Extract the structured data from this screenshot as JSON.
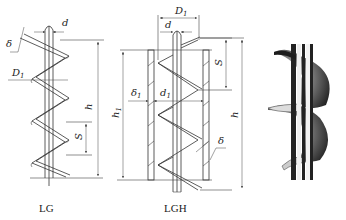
{
  "diagrams": [
    {
      "id": "LG",
      "caption": "LG",
      "labels": {
        "d": "d",
        "delta": "δ",
        "D1": "D",
        "D1_sub": "1",
        "h": "h",
        "S": "S"
      }
    },
    {
      "id": "LGH",
      "caption": "LGH",
      "labels": {
        "D1": "D",
        "D1_sub": "1",
        "d": "d",
        "S": "S",
        "delta1": "δ",
        "delta1_sub": "1",
        "d1": "d",
        "d1_sub": "1",
        "h1": "h",
        "h1_sub": "1",
        "h": "h",
        "delta": "δ"
      }
    },
    {
      "id": "photo",
      "description": "Photograph of a helical screw auger on a central shaft"
    }
  ],
  "colors": {
    "line": "#333333",
    "background": "#ffffff"
  }
}
